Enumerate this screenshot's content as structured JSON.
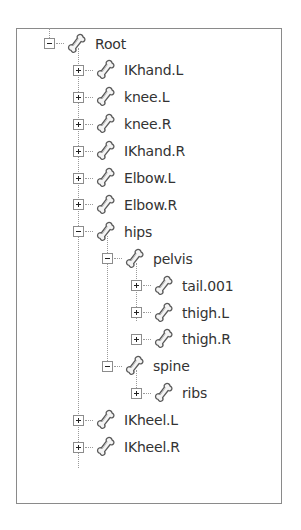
{
  "tree": {
    "nodes": [
      {
        "label": "Root",
        "depth": 0,
        "state": "expanded"
      },
      {
        "label": "IKhand.L",
        "depth": 1,
        "state": "collapsed"
      },
      {
        "label": "knee.L",
        "depth": 1,
        "state": "collapsed"
      },
      {
        "label": "knee.R",
        "depth": 1,
        "state": "collapsed"
      },
      {
        "label": "IKhand.R",
        "depth": 1,
        "state": "collapsed"
      },
      {
        "label": "Elbow.L",
        "depth": 1,
        "state": "collapsed"
      },
      {
        "label": "Elbow.R",
        "depth": 1,
        "state": "collapsed"
      },
      {
        "label": "hips",
        "depth": 1,
        "state": "expanded"
      },
      {
        "label": "pelvis",
        "depth": 2,
        "state": "expanded"
      },
      {
        "label": "tail.001",
        "depth": 3,
        "state": "collapsed"
      },
      {
        "label": "thigh.L",
        "depth": 3,
        "state": "collapsed"
      },
      {
        "label": "thigh.R",
        "depth": 3,
        "state": "collapsed"
      },
      {
        "label": "spine",
        "depth": 2,
        "state": "expanded"
      },
      {
        "label": "ribs",
        "depth": 3,
        "state": "collapsed"
      },
      {
        "label": "IKheel.L",
        "depth": 1,
        "state": "collapsed"
      },
      {
        "label": "IKheel.R",
        "depth": 1,
        "state": "collapsed"
      }
    ],
    "node_icon": "bone-icon",
    "colors": {
      "border": "#8a8a8a",
      "text": "#333333",
      "connector": "#9a9a9a"
    }
  }
}
